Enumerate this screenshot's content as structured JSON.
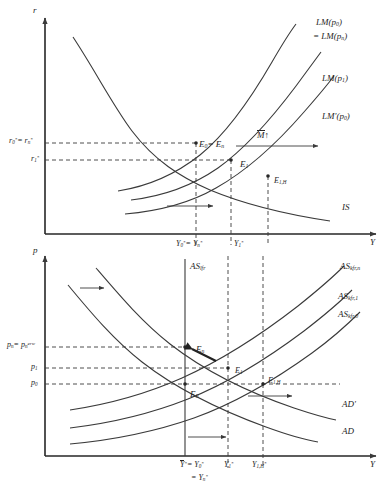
{
  "figure": {
    "kind": "macroeconomics-diagram",
    "line_color": "#3a3a3a",
    "text_color": "#262626"
  },
  "top_panel": {
    "name": "is-lm-panel",
    "axes": {
      "y_label": "r",
      "x_label": "Y"
    },
    "curves": [
      {
        "id": "lm_p0_n",
        "label_line1": "LM(p",
        "label_sub1": "0",
        "label_line1_end": ")",
        "label_line2_pre": "= LM(p",
        "label_sub2": "n",
        "label_line2_end": ")"
      },
      {
        "id": "lm_p1",
        "label": "LM(p",
        "sub": "1",
        "close": ")"
      },
      {
        "id": "lm_prime_p0",
        "label": "LM'(p",
        "sub": "0",
        "close": ")"
      },
      {
        "id": "is",
        "label": "IS"
      }
    ],
    "shift_annotation": {
      "symbol": "M",
      "overbar": true,
      "arrow": "↑"
    },
    "equilibria": [
      {
        "id": "E0_En",
        "label": "E",
        "sub": "0",
        "eq": "= E",
        "sub2": "n"
      },
      {
        "id": "E1",
        "label": "E",
        "sub": "1"
      },
      {
        "id": "E1H",
        "label": "E",
        "sub": "1,H"
      }
    ],
    "y_ticks": [
      {
        "id": "r0_rn",
        "text": "r",
        "sub": "0",
        "star": "*",
        "eq": "= r",
        "sub2": "n",
        "star2": "*"
      },
      {
        "id": "r1",
        "text": "r",
        "sub": "1",
        "star": "*"
      }
    ],
    "x_ticks": [
      {
        "id": "Y0_Yn",
        "text": "Y",
        "sub": "0",
        "star": "*",
        "eq": "= Y",
        "sub2": "n",
        "star2": "*"
      },
      {
        "id": "Y1",
        "text": "Y",
        "sub": "1",
        "star": "*"
      }
    ]
  },
  "bottom_panel": {
    "name": "ad-as-panel",
    "axes": {
      "y_label": "p",
      "x_label": "Y"
    },
    "curves": [
      {
        "id": "as_lfr",
        "label": "AS",
        "sub": "lfr"
      },
      {
        "id": "as_kfr_n",
        "label": "AS",
        "sub": "kfr,n"
      },
      {
        "id": "as_kfr_1",
        "label": "AS",
        "sub": "kfr,1"
      },
      {
        "id": "as_kfr_0",
        "label": "AS",
        "sub": "kfr,0"
      },
      {
        "id": "ad_prime",
        "label": "AD'"
      },
      {
        "id": "ad",
        "label": "AD"
      }
    ],
    "equilibria": [
      {
        "id": "En",
        "label": "E",
        "sub": "n"
      },
      {
        "id": "E0",
        "label": "E",
        "sub": "0"
      },
      {
        "id": "E1",
        "label": "E",
        "sub": "1"
      },
      {
        "id": "E1H",
        "label": "E",
        "sub": "1,H"
      }
    ],
    "y_ticks": [
      {
        "id": "pn",
        "text": "p",
        "sub": "n",
        "eq": "= p",
        "sub2": "n",
        "sup2": "erw"
      },
      {
        "id": "p1",
        "text": "p",
        "sub": "1"
      },
      {
        "id": "p0",
        "text": "p",
        "sub": "0"
      }
    ],
    "x_ticks": [
      {
        "id": "Ybar",
        "text": "Y",
        "star": "*",
        "overbar": true,
        "eq": "= Y",
        "sub2": "0",
        "star2": "*",
        "line2_eq": "= Y",
        "line2_sub": "n",
        "line2_star": "*"
      },
      {
        "id": "Y1",
        "text": "Y",
        "sub": "1",
        "star": "*"
      },
      {
        "id": "Y1H",
        "text": "Y",
        "sub": "1,H",
        "star": "*"
      }
    ]
  }
}
